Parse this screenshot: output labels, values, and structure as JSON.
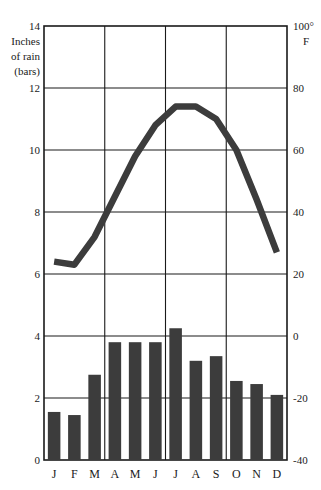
{
  "chart_data": {
    "type": "bar",
    "title": "",
    "categories": [
      "J",
      "F",
      "M",
      "A",
      "M",
      "J",
      "J",
      "A",
      "S",
      "O",
      "N",
      "D"
    ],
    "month_labels": [
      "J",
      "F",
      "M",
      "A",
      "M",
      "J",
      "J",
      "A",
      "S",
      "O",
      "N",
      "D"
    ],
    "series": [
      {
        "name": "Inches of rain (bars)",
        "kind": "bar",
        "axis": "left",
        "values": [
          1.55,
          1.45,
          2.75,
          3.8,
          3.8,
          3.8,
          4.25,
          3.2,
          3.35,
          2.55,
          2.45,
          2.1
        ]
      },
      {
        "name": "Temperature (line)",
        "kind": "line",
        "axis": "right",
        "values": [
          24,
          23,
          32,
          45,
          58,
          68,
          74,
          74,
          70,
          60,
          44,
          27
        ],
        "left_axis_equivalent": [
          6.2,
          6.15,
          6.8,
          8.1,
          9.5,
          10.75,
          11.5,
          11.5,
          11.1,
          10.0,
          8.5,
          6.8
        ]
      }
    ],
    "xlabel": "",
    "ylabel": "Inches of rain (bars)",
    "y2label": "100° F",
    "left_axis": {
      "label_lines": [
        "Inches",
        "of rain",
        "(bars)"
      ],
      "ticks": [
        0,
        2,
        4,
        6,
        8,
        10,
        12,
        14
      ],
      "tick_labels": [
        "0",
        "2",
        "4",
        "6",
        "8",
        "10",
        "12",
        "14"
      ],
      "ylim": [
        0,
        14
      ],
      "top_label": "14"
    },
    "right_axis": {
      "ticks": [
        -40,
        -20,
        0,
        20,
        40,
        60,
        80,
        100
      ],
      "tick_labels": [
        "-40",
        "-20",
        "0",
        "20",
        "40",
        "60",
        "80",
        "100°"
      ],
      "unit_label": "F",
      "ylim": [
        -40,
        100
      ],
      "top_label": "100°"
    },
    "grid": {
      "horizontal": true,
      "vertical": true,
      "horizontal_at": [
        2,
        4,
        6,
        8,
        10,
        12
      ],
      "vertical_after_months": [
        "M",
        "J",
        "S"
      ]
    },
    "legend": {
      "position": "none",
      "entries": []
    },
    "colors": {
      "bar": "#3c3c3c",
      "line": "#3c3c3c",
      "axis": "#1a1a1a",
      "grid": "#1a1a1a",
      "background": "#ffffff"
    }
  }
}
